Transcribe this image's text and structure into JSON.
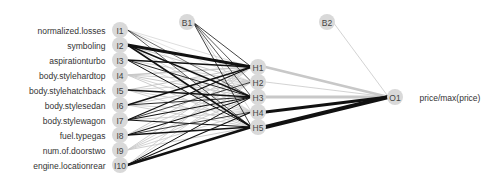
{
  "diagram": {
    "type": "neural-network",
    "colors": {
      "positive": "#111111",
      "negative": "#c8c8c8",
      "node_fill": "#d9d9d9",
      "node_text": "#444444",
      "label_text": "#333333"
    },
    "input_layer": {
      "x": 120,
      "nodes": [
        {
          "id": "I1",
          "label": "normalized.losses",
          "y": 30
        },
        {
          "id": "I2",
          "label": "symboling",
          "y": 45
        },
        {
          "id": "I3",
          "label": "aspirationturbo",
          "y": 60
        },
        {
          "id": "I4",
          "label": "body.stylehardtop",
          "y": 75
        },
        {
          "id": "I5",
          "label": "body.stylehatchback",
          "y": 90
        },
        {
          "id": "I6",
          "label": "body.stylesedan",
          "y": 105
        },
        {
          "id": "I7",
          "label": "body.stylewagon",
          "y": 120
        },
        {
          "id": "I8",
          "label": "fuel.typegas",
          "y": 135
        },
        {
          "id": "I9",
          "label": "num.of.doorstwo",
          "y": 150
        },
        {
          "id": "I10",
          "label": "engine.locationrear",
          "y": 165
        }
      ]
    },
    "bias_nodes": [
      {
        "id": "B1",
        "x": 187,
        "y": 22
      },
      {
        "id": "B2",
        "x": 327,
        "y": 22
      }
    ],
    "hidden_layer": {
      "x": 258,
      "nodes": [
        {
          "id": "H1",
          "y": 67
        },
        {
          "id": "H2",
          "y": 82
        },
        {
          "id": "H3",
          "y": 97
        },
        {
          "id": "H4",
          "y": 112
        },
        {
          "id": "H5",
          "y": 127
        }
      ]
    },
    "output_layer": {
      "x": 395,
      "nodes": [
        {
          "id": "O1",
          "label": "price/max(price)",
          "y": 97
        }
      ]
    },
    "edges": [
      {
        "from": "I1",
        "to": "H1",
        "sign": "neg",
        "w": 0.6
      },
      {
        "from": "I1",
        "to": "H2",
        "sign": "neg",
        "w": 0.5
      },
      {
        "from": "I1",
        "to": "H3",
        "sign": "pos",
        "w": 0.6
      },
      {
        "from": "I1",
        "to": "H4",
        "sign": "neg",
        "w": 0.5
      },
      {
        "from": "I1",
        "to": "H5",
        "sign": "pos",
        "w": 0.7
      },
      {
        "from": "I2",
        "to": "H1",
        "sign": "pos",
        "w": 3.2
      },
      {
        "from": "I2",
        "to": "H2",
        "sign": "neg",
        "w": 1.0
      },
      {
        "from": "I2",
        "to": "H3",
        "sign": "pos",
        "w": 1.4
      },
      {
        "from": "I2",
        "to": "H4",
        "sign": "neg",
        "w": 0.8
      },
      {
        "from": "I2",
        "to": "H5",
        "sign": "pos",
        "w": 1.5
      },
      {
        "from": "I3",
        "to": "H1",
        "sign": "pos",
        "w": 1.3
      },
      {
        "from": "I3",
        "to": "H2",
        "sign": "neg",
        "w": 0.8
      },
      {
        "from": "I3",
        "to": "H3",
        "sign": "pos",
        "w": 0.9
      },
      {
        "from": "I3",
        "to": "H4",
        "sign": "neg",
        "w": 0.6
      },
      {
        "from": "I3",
        "to": "H5",
        "sign": "pos",
        "w": 1.0
      },
      {
        "from": "I4",
        "to": "H1",
        "sign": "neg",
        "w": 1.4
      },
      {
        "from": "I4",
        "to": "H2",
        "sign": "neg",
        "w": 0.9
      },
      {
        "from": "I4",
        "to": "H3",
        "sign": "neg",
        "w": 1.0
      },
      {
        "from": "I4",
        "to": "H4",
        "sign": "neg",
        "w": 0.8
      },
      {
        "from": "I4",
        "to": "H5",
        "sign": "neg",
        "w": 0.9
      },
      {
        "from": "I5",
        "to": "H1",
        "sign": "neg",
        "w": 1.0
      },
      {
        "from": "I5",
        "to": "H2",
        "sign": "neg",
        "w": 0.8
      },
      {
        "from": "I5",
        "to": "H3",
        "sign": "pos",
        "w": 1.6
      },
      {
        "from": "I5",
        "to": "H4",
        "sign": "neg",
        "w": 0.8
      },
      {
        "from": "I5",
        "to": "H5",
        "sign": "neg",
        "w": 0.9
      },
      {
        "from": "I6",
        "to": "H1",
        "sign": "pos",
        "w": 1.5
      },
      {
        "from": "I6",
        "to": "H2",
        "sign": "neg",
        "w": 0.9
      },
      {
        "from": "I6",
        "to": "H3",
        "sign": "pos",
        "w": 0.9
      },
      {
        "from": "I6",
        "to": "H4",
        "sign": "neg",
        "w": 0.8
      },
      {
        "from": "I6",
        "to": "H5",
        "sign": "neg",
        "w": 0.9
      },
      {
        "from": "I7",
        "to": "H1",
        "sign": "pos",
        "w": 1.3
      },
      {
        "from": "I7",
        "to": "H2",
        "sign": "pos",
        "w": 0.8
      },
      {
        "from": "I7",
        "to": "H3",
        "sign": "pos",
        "w": 1.1
      },
      {
        "from": "I7",
        "to": "H4",
        "sign": "neg",
        "w": 0.9
      },
      {
        "from": "I7",
        "to": "H5",
        "sign": "pos",
        "w": 1.0
      },
      {
        "from": "I8",
        "to": "H1",
        "sign": "neg",
        "w": 1.0
      },
      {
        "from": "I8",
        "to": "H2",
        "sign": "neg",
        "w": 0.8
      },
      {
        "from": "I8",
        "to": "H3",
        "sign": "pos",
        "w": 1.1
      },
      {
        "from": "I8",
        "to": "H4",
        "sign": "pos",
        "w": 0.8
      },
      {
        "from": "I8",
        "to": "H5",
        "sign": "pos",
        "w": 1.3
      },
      {
        "from": "I9",
        "to": "H1",
        "sign": "neg",
        "w": 0.9
      },
      {
        "from": "I9",
        "to": "H2",
        "sign": "neg",
        "w": 0.8
      },
      {
        "from": "I9",
        "to": "H3",
        "sign": "neg",
        "w": 0.9
      },
      {
        "from": "I9",
        "to": "H4",
        "sign": "neg",
        "w": 0.8
      },
      {
        "from": "I9",
        "to": "H5",
        "sign": "neg",
        "w": 0.9
      },
      {
        "from": "I10",
        "to": "H1",
        "sign": "neg",
        "w": 0.8
      },
      {
        "from": "I10",
        "to": "H2",
        "sign": "neg",
        "w": 0.7
      },
      {
        "from": "I10",
        "to": "H3",
        "sign": "pos",
        "w": 1.0
      },
      {
        "from": "I10",
        "to": "H4",
        "sign": "pos",
        "w": 1.1
      },
      {
        "from": "I10",
        "to": "H5",
        "sign": "pos",
        "w": 2.4
      },
      {
        "from": "B1",
        "to": "H1",
        "sign": "pos",
        "w": 0.8
      },
      {
        "from": "B1",
        "to": "H2",
        "sign": "pos",
        "w": 0.7
      },
      {
        "from": "B1",
        "to": "H3",
        "sign": "pos",
        "w": 0.7
      },
      {
        "from": "B1",
        "to": "H4",
        "sign": "neg",
        "w": 0.8
      },
      {
        "from": "B1",
        "to": "H5",
        "sign": "pos",
        "w": 0.8
      },
      {
        "from": "H1",
        "to": "O1",
        "sign": "neg",
        "w": 2.8
      },
      {
        "from": "H2",
        "to": "O1",
        "sign": "neg",
        "w": 0.8
      },
      {
        "from": "H3",
        "to": "O1",
        "sign": "neg",
        "w": 2.8
      },
      {
        "from": "H4",
        "to": "O1",
        "sign": "pos",
        "w": 3.0
      },
      {
        "from": "H5",
        "to": "O1",
        "sign": "pos",
        "w": 4.0
      },
      {
        "from": "B2",
        "to": "O1",
        "sign": "neg",
        "w": 0.8
      }
    ]
  }
}
